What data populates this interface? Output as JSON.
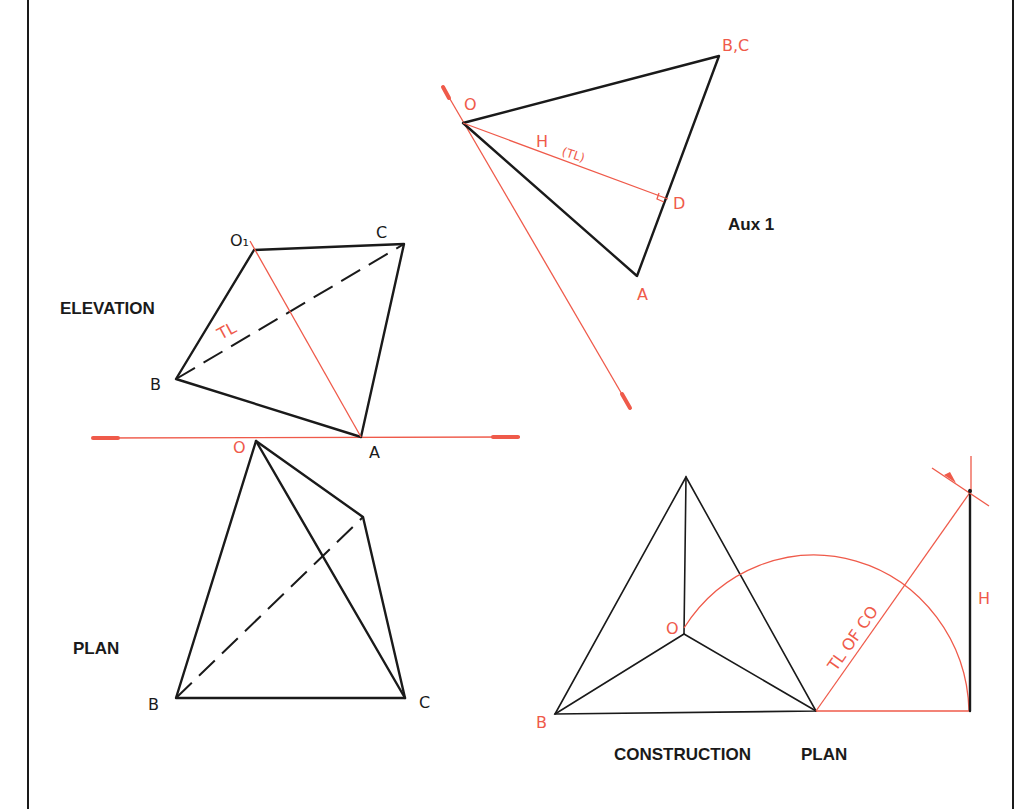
{
  "colors": {
    "line": "#1a1a1a",
    "construction": "#ef5a4a",
    "background": "#ffffff"
  },
  "views": {
    "aux1": {
      "title": "Aux 1",
      "labels": {
        "o": "O",
        "bc": "B,C",
        "a": "A",
        "d": "D",
        "h": "H",
        "tl": "(TL)"
      }
    },
    "elevation": {
      "title": "ELEVATION",
      "labels": {
        "o1": "O₁",
        "c": "C",
        "b": "B",
        "a": "A",
        "tl": "TL"
      }
    },
    "plan": {
      "title": "PLAN",
      "labels": {
        "o": "O",
        "b": "B",
        "c": "C"
      }
    },
    "construction_plan": {
      "title_left": "CONSTRUCTION",
      "title_right": "PLAN",
      "labels": {
        "o": "O",
        "b": "B",
        "tl_of_co": "TL OF CO",
        "h": "H"
      }
    }
  }
}
